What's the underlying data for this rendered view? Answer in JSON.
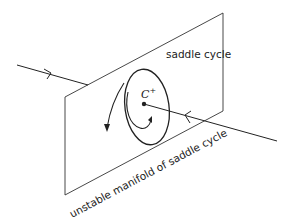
{
  "diagram": {
    "labels": {
      "plane": "saddle cycle",
      "manifold": "unstable manifold of saddle cycle",
      "point": "C",
      "point_sup": "+"
    },
    "colors": {
      "stroke": "#222222",
      "background": "#ffffff"
    }
  }
}
